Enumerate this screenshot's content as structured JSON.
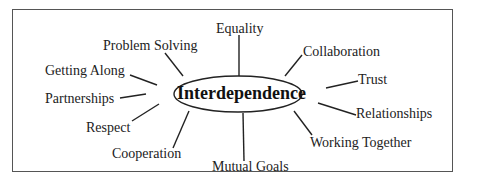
{
  "diagram": {
    "center": "Interdependence",
    "nodes": [
      {
        "id": "equality",
        "label": "Equality"
      },
      {
        "id": "collaboration",
        "label": "Collaboration"
      },
      {
        "id": "trust",
        "label": "Trust"
      },
      {
        "id": "relationships",
        "label": "Relationships"
      },
      {
        "id": "working-together",
        "label": "Working Together"
      },
      {
        "id": "mutual-goals",
        "label": "Mutual Goals"
      },
      {
        "id": "cooperation",
        "label": "Cooperation"
      },
      {
        "id": "respect",
        "label": "Respect"
      },
      {
        "id": "partnerships",
        "label": "Partnerships"
      },
      {
        "id": "getting-along",
        "label": "Getting Along"
      },
      {
        "id": "problem-solving",
        "label": "Problem Solving"
      }
    ]
  }
}
